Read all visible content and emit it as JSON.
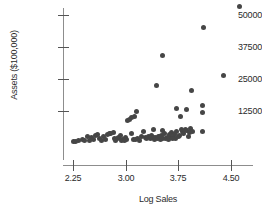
{
  "chart_data": {
    "type": "scatter",
    "title": "",
    "xlabel": "Log Sales",
    "ylabel": "Assets ($100,000)",
    "xlim": [
      2.18,
      4.9
    ],
    "ylim": [
      0,
      57000
    ],
    "xticks": [
      2.25,
      3.0,
      3.75,
      4.5
    ],
    "xtick_labels": [
      "2.25",
      "3.00",
      "3.75",
      "4.50"
    ],
    "yticks": [
      12500,
      25000,
      37500,
      50000
    ],
    "ytick_labels": [
      "12500",
      "25000",
      "37500",
      "50000"
    ],
    "grid": false,
    "legend": null,
    "marker_color": "#464646",
    "axis_color": "#8d8d8d",
    "points": [
      {
        "x": 2.26,
        "y": 600
      },
      {
        "x": 2.29,
        "y": 700
      },
      {
        "x": 2.33,
        "y": 900
      },
      {
        "x": 2.38,
        "y": 1300
      },
      {
        "x": 2.42,
        "y": 1100
      },
      {
        "x": 2.45,
        "y": 2400
      },
      {
        "x": 2.48,
        "y": 1000
      },
      {
        "x": 2.51,
        "y": 2300
      },
      {
        "x": 2.54,
        "y": 1500
      },
      {
        "x": 2.57,
        "y": 3100
      },
      {
        "x": 2.6,
        "y": 3200
      },
      {
        "x": 2.63,
        "y": 1900
      },
      {
        "x": 2.66,
        "y": 900
      },
      {
        "x": 2.69,
        "y": 2600
      },
      {
        "x": 2.71,
        "y": 1300
      },
      {
        "x": 2.74,
        "y": 3500
      },
      {
        "x": 2.77,
        "y": 3900
      },
      {
        "x": 2.79,
        "y": 3800
      },
      {
        "x": 2.82,
        "y": 4200
      },
      {
        "x": 2.84,
        "y": 1900
      },
      {
        "x": 2.86,
        "y": 900
      },
      {
        "x": 2.88,
        "y": 1600
      },
      {
        "x": 2.9,
        "y": 2100
      },
      {
        "x": 2.92,
        "y": 2900
      },
      {
        "x": 2.94,
        "y": 1100
      },
      {
        "x": 2.96,
        "y": 1400
      },
      {
        "x": 2.98,
        "y": 1000
      },
      {
        "x": 3.0,
        "y": 2000
      },
      {
        "x": 3.01,
        "y": 1500
      },
      {
        "x": 3.03,
        "y": 8600
      },
      {
        "x": 3.06,
        "y": 9200
      },
      {
        "x": 3.09,
        "y": 9900
      },
      {
        "x": 3.12,
        "y": 10400
      },
      {
        "x": 3.15,
        "y": 12400
      },
      {
        "x": 3.08,
        "y": 3700
      },
      {
        "x": 3.11,
        "y": 1200
      },
      {
        "x": 3.14,
        "y": 1500
      },
      {
        "x": 3.17,
        "y": 1800
      },
      {
        "x": 3.2,
        "y": 1000
      },
      {
        "x": 3.23,
        "y": 2600
      },
      {
        "x": 3.26,
        "y": 4500
      },
      {
        "x": 3.28,
        "y": 2000
      },
      {
        "x": 3.3,
        "y": 1600
      },
      {
        "x": 3.33,
        "y": 2400
      },
      {
        "x": 3.35,
        "y": 1700
      },
      {
        "x": 3.37,
        "y": 2800
      },
      {
        "x": 3.39,
        "y": 2000
      },
      {
        "x": 3.41,
        "y": 1300
      },
      {
        "x": 3.43,
        "y": 2200
      },
      {
        "x": 3.45,
        "y": 1800
      },
      {
        "x": 3.47,
        "y": 2400
      },
      {
        "x": 3.49,
        "y": 1500
      },
      {
        "x": 3.51,
        "y": 2900
      },
      {
        "x": 3.53,
        "y": 1900
      },
      {
        "x": 3.55,
        "y": 3900
      },
      {
        "x": 3.57,
        "y": 1700
      },
      {
        "x": 3.59,
        "y": 2300
      },
      {
        "x": 3.61,
        "y": 1400
      },
      {
        "x": 3.63,
        "y": 2600
      },
      {
        "x": 3.65,
        "y": 4200
      },
      {
        "x": 3.67,
        "y": 2100
      },
      {
        "x": 3.69,
        "y": 3400
      },
      {
        "x": 3.71,
        "y": 1800
      },
      {
        "x": 3.73,
        "y": 4600
      },
      {
        "x": 3.75,
        "y": 2500
      },
      {
        "x": 3.77,
        "y": 3000
      },
      {
        "x": 3.79,
        "y": 5100
      },
      {
        "x": 3.81,
        "y": 4400
      },
      {
        "x": 3.83,
        "y": 3600
      },
      {
        "x": 3.85,
        "y": 5300
      },
      {
        "x": 3.87,
        "y": 4800
      },
      {
        "x": 3.89,
        "y": 2700
      },
      {
        "x": 3.91,
        "y": 4000
      },
      {
        "x": 3.93,
        "y": 5600
      },
      {
        "x": 3.95,
        "y": 4300
      },
      {
        "x": 3.4,
        "y": 5200
      },
      {
        "x": 3.52,
        "y": 4700
      },
      {
        "x": 3.62,
        "y": 3300
      },
      {
        "x": 3.48,
        "y": 2700
      },
      {
        "x": 3.66,
        "y": 1900
      },
      {
        "x": 3.44,
        "y": 22300
      },
      {
        "x": 3.52,
        "y": 34000
      },
      {
        "x": 3.72,
        "y": 13500
      },
      {
        "x": 3.78,
        "y": 10200
      },
      {
        "x": 3.86,
        "y": 13200
      },
      {
        "x": 3.94,
        "y": 20500
      },
      {
        "x": 4.1,
        "y": 14500
      },
      {
        "x": 4.09,
        "y": 11800
      },
      {
        "x": 4.11,
        "y": 45000
      },
      {
        "x": 4.1,
        "y": 4600
      },
      {
        "x": 4.4,
        "y": 26200
      },
      {
        "x": 4.62,
        "y": 53500
      }
    ]
  },
  "axes": {
    "y_label": "Assets ($100,000)",
    "x_label": "Log Sales"
  }
}
